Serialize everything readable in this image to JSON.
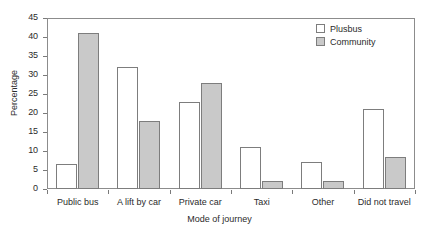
{
  "chart_data": {
    "type": "bar",
    "title": "",
    "xlabel": "Mode of journey",
    "ylabel": "Percentage",
    "ylim": [
      0,
      45
    ],
    "ytick_step": 5,
    "yticks": [
      0,
      5,
      10,
      15,
      20,
      25,
      30,
      35,
      40,
      45
    ],
    "grid": false,
    "legend_position": "top-right",
    "categories": [
      "Public bus",
      "A lift by car",
      "Private car",
      "Taxi",
      "Other",
      "Did not travel"
    ],
    "series": [
      {
        "name": "Plusbus",
        "color": "#ffffff",
        "values": [
          6.5,
          32,
          23,
          11,
          7,
          21
        ]
      },
      {
        "name": "Community",
        "color": "#c9c9c9",
        "values": [
          41,
          18,
          28,
          2,
          2,
          8.5
        ]
      }
    ]
  },
  "legend": {
    "items": [
      {
        "label": "Plusbus",
        "swatch": "white-square-icon"
      },
      {
        "label": "Community",
        "swatch": "gray-square-icon"
      }
    ]
  },
  "axes": {
    "y_title": "Percentage",
    "x_title": "Mode of journey",
    "y_tick_labels": [
      "0",
      "5",
      "10",
      "15",
      "20",
      "25",
      "30",
      "35",
      "40",
      "45"
    ],
    "x_tick_labels": [
      "Public bus",
      "A lift by car",
      "Private car",
      "Taxi",
      "Other",
      "Did not travel"
    ]
  }
}
